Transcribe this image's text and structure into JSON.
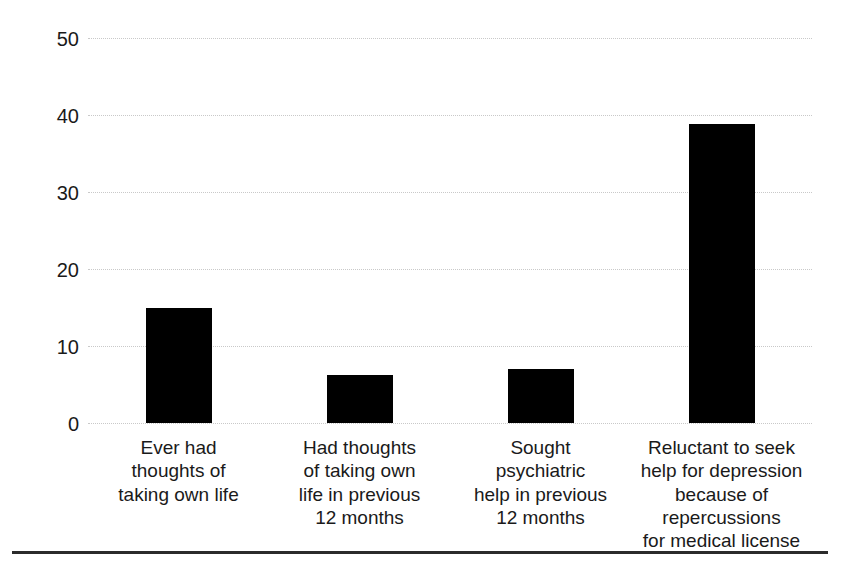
{
  "chart_data": {
    "type": "bar",
    "title": "",
    "xlabel": "",
    "ylabel": "Percent of sample",
    "ylim": [
      0,
      50
    ],
    "ytick_step": 10,
    "yticks": [
      "50",
      "40",
      "30",
      "20",
      "10",
      "0"
    ],
    "grid": true,
    "legend": null,
    "bar_color": "#000000",
    "gridline_color": "#c9c9c9",
    "background_color": "#ffffff",
    "categories": [
      "Ever had thoughts of taking own life",
      "Had thoughts of taking own life in previous 12 months",
      "Sought psychiatric help in previous 12 months",
      "Reluctant to seek help for depression because of repercussions for medical license"
    ],
    "category_label_lines": [
      [
        "Ever had",
        "thoughts of",
        "taking own life"
      ],
      [
        "Had thoughts",
        "of taking own",
        "life in previous",
        "12 months"
      ],
      [
        "Sought",
        "psychiatric",
        "help in previous",
        "12 months"
      ],
      [
        "Reluctant to seek",
        "help for depression",
        "because of repercussions",
        "for medical license"
      ]
    ],
    "values": [
      14.9,
      6.2,
      7.0,
      38.8
    ]
  },
  "bottom_rule": {
    "color": "#2b2b2b"
  }
}
